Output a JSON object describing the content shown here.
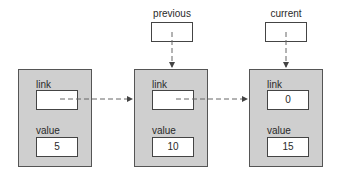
{
  "pointers": [
    {
      "label": "previous"
    },
    {
      "label": "current"
    }
  ],
  "nodes": [
    {
      "link_label": "link",
      "link_value": "",
      "value_label": "value",
      "value": "5"
    },
    {
      "link_label": "link",
      "link_value": "",
      "value_label": "value",
      "value": "10"
    },
    {
      "link_label": "link",
      "link_value": "0",
      "value_label": "value",
      "value": "15"
    }
  ],
  "colors": {
    "node_fill": "#cfcfcf",
    "border": "#555555",
    "arrow": "#555555"
  }
}
